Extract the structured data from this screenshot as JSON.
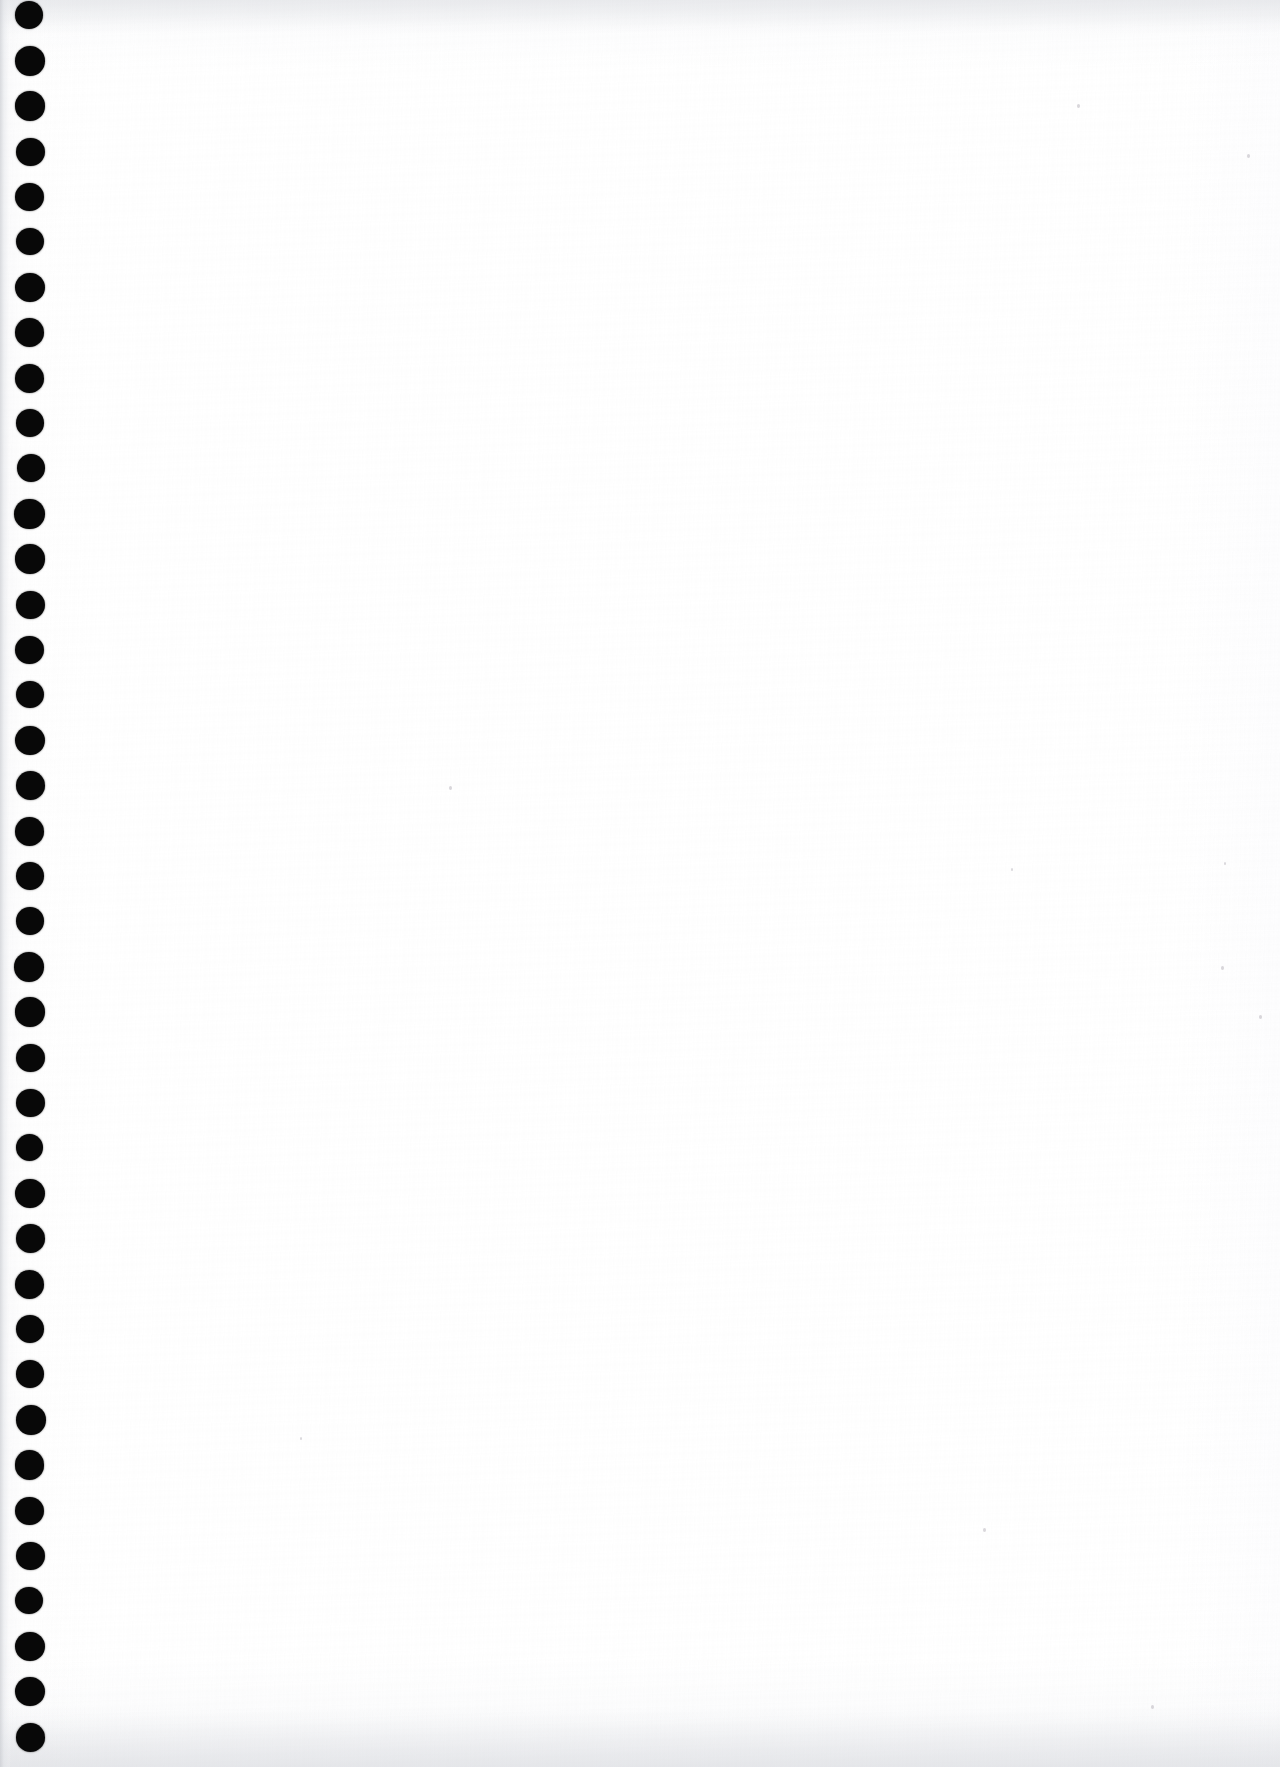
{
  "document": {
    "type": "scanned-page",
    "title": "Blank notebook page (scan)",
    "page_label": "",
    "orientation": "portrait",
    "width_px": 1280,
    "height_px": 1767,
    "body_text": "",
    "is_blank": true
  },
  "paper": {
    "background_color": "#ffffff",
    "edge_shadow_color": "#c6c8cd",
    "grain_color": "#000000",
    "left_margin_strip_color": "#f3f4f6"
  },
  "binding": {
    "type": "punched-holes",
    "hole_color": "#080808",
    "hole_count": 39,
    "hole_diameter_px": 29,
    "hole_center_x_px": 30,
    "first_hole_center_y_px": 16,
    "hole_spacing_px": 45.3,
    "edge_label": "binding edge"
  },
  "specks": [
    {
      "x": 1077,
      "y": 104,
      "size": 3
    },
    {
      "x": 1247,
      "y": 154,
      "size": 3
    },
    {
      "x": 449,
      "y": 786,
      "size": 3
    },
    {
      "x": 1221,
      "y": 966,
      "size": 3
    },
    {
      "x": 1259,
      "y": 1015,
      "size": 3
    },
    {
      "x": 1011,
      "y": 868,
      "size": 2
    },
    {
      "x": 1224,
      "y": 862,
      "size": 2
    },
    {
      "x": 983,
      "y": 1528,
      "size": 3
    },
    {
      "x": 300,
      "y": 1437,
      "size": 2
    },
    {
      "x": 1151,
      "y": 1705,
      "size": 3
    }
  ]
}
